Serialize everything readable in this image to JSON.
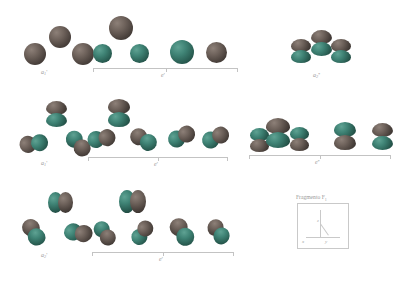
{
  "figure": {
    "background_color": "#ffffff",
    "colors": {
      "lobe_positive": "#6e625b",
      "lobe_negative": "#3f8375",
      "bracket": "#c3c3c3",
      "label_text": "#9a9a9a"
    }
  },
  "rows": [
    {
      "id": "row-s",
      "orbital_type": "s",
      "groups": [
        {
          "id": "a1-prime-s",
          "label": "a",
          "subscript": "1",
          "prime": "'",
          "label_full": "a1'",
          "bracketed": false,
          "orbital_count": 3
        },
        {
          "id": "e-prime-s",
          "label": "e",
          "subscript": "",
          "prime": "'",
          "label_full": "e'",
          "bracketed": true,
          "orbital_count": 6
        },
        {
          "id": "a2-double-prime-s",
          "label": "a",
          "subscript": "2",
          "prime": "''",
          "label_full": "a2''",
          "bracketed": false,
          "orbital_count": 3
        }
      ]
    },
    {
      "id": "row-pz",
      "orbital_type": "p-vertical",
      "groups": [
        {
          "id": "a1-prime-p",
          "label": "a",
          "subscript": "1",
          "prime": "'",
          "label_full": "a1'",
          "bracketed": false,
          "orbital_count": 3
        },
        {
          "id": "e-prime-p",
          "label": "e",
          "subscript": "",
          "prime": "'",
          "label_full": "e'",
          "bracketed": true,
          "orbital_count": 6
        },
        {
          "id": "e-double-prime-p",
          "label": "e",
          "subscript": "",
          "prime": "''",
          "label_full": "e''",
          "bracketed": true,
          "orbital_count": 6
        }
      ]
    },
    {
      "id": "row-pxy",
      "orbital_type": "p-horizontal",
      "groups": [
        {
          "id": "a2-prime-p",
          "label": "a",
          "subscript": "2",
          "prime": "'",
          "label_full": "a2'",
          "bracketed": false,
          "orbital_count": 3
        },
        {
          "id": "e-prime-p2",
          "label": "e",
          "subscript": "",
          "prime": "'",
          "label_full": "e'",
          "bracketed": true,
          "orbital_count": 6
        }
      ]
    }
  ],
  "legend": {
    "title_text": "Fragmento F",
    "title_subscript": "1",
    "axis_x_label": "x",
    "axis_y_label": "y",
    "axis_z_label": "z"
  }
}
